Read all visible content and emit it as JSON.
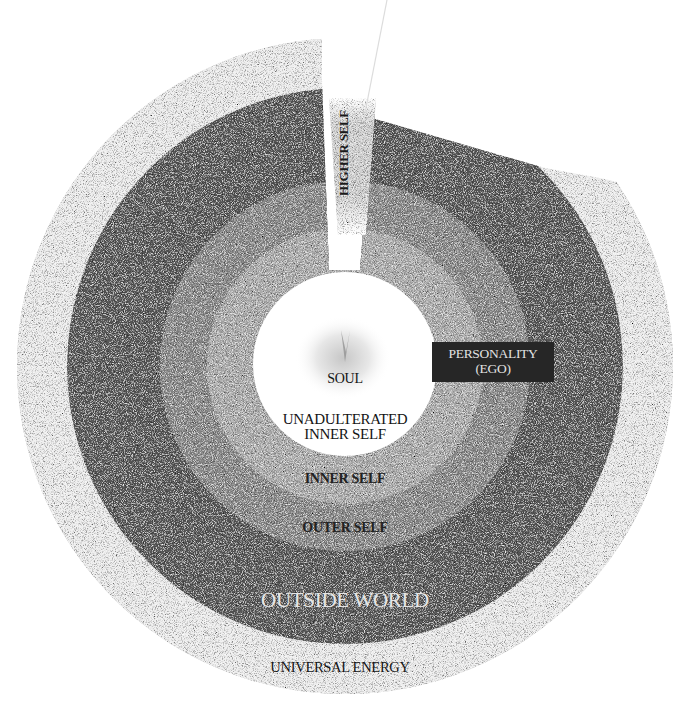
{
  "diagram": {
    "type": "concentric-layers",
    "center": {
      "x": 345,
      "y": 366
    },
    "layers": [
      {
        "id": "universal-energy",
        "label": "UNIVERSAL ENERGY",
        "radius": 328,
        "fill": "#ebebeb"
      },
      {
        "id": "outside-world",
        "label": "OUTSIDE WORLD",
        "radius": 278,
        "fill": "#595959"
      },
      {
        "id": "outer-self",
        "label": "OUTER SELF",
        "radius": 185,
        "fill": "#8a8a8a"
      },
      {
        "id": "inner-self",
        "label": "INNER SELF",
        "radius": 138,
        "fill": "#adadad"
      },
      {
        "id": "unadulterated-inner-self",
        "label": "UNADULTERATED INNER SELF",
        "radius": 92,
        "fill": "#ffffff"
      }
    ],
    "core": {
      "label": "SOUL"
    },
    "wedge": {
      "label": "HIGHER SELF"
    },
    "callout": {
      "label_line1": "PERSONALITY",
      "label_line2": "(EGO)",
      "fill": "#262626"
    }
  },
  "labels": {
    "soul": "SOUL",
    "unadulterated_line1": "UNADULTERATED",
    "unadulterated_line2": "INNER SELF",
    "inner_self": "INNER SELF",
    "outer_self": "OUTER SELF",
    "outside_world": "OUTSIDE WORLD",
    "universal_energy": "UNIVERSAL ENERGY",
    "personality_line1": "PERSONALITY",
    "personality_line2": "(EGO)",
    "higher_self": "HIGHER SELF"
  }
}
